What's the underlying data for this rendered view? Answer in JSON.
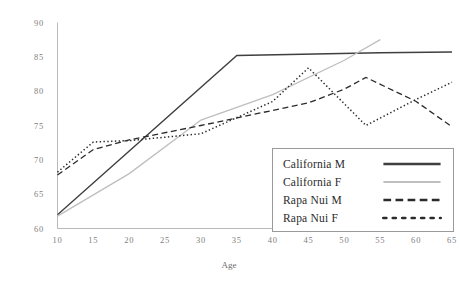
{
  "chart_data": {
    "type": "line",
    "title": "",
    "xlabel": "Age",
    "ylabel": "",
    "xlim": [
      10,
      65
    ],
    "ylim": [
      60,
      90
    ],
    "xticks": [
      10,
      15,
      20,
      25,
      30,
      35,
      40,
      45,
      50,
      55,
      60,
      65
    ],
    "yticks": [
      60,
      65,
      70,
      75,
      80,
      85,
      90
    ],
    "grid": false,
    "legend_position": "center-right",
    "series": [
      {
        "name": "California M",
        "style": "solid",
        "color": "#3f3f3f",
        "x": [
          10,
          35,
          55,
          65
        ],
        "values": [
          62.0,
          85.2,
          85.6,
          85.7
        ]
      },
      {
        "name": "California F",
        "style": "solid-light",
        "color": "#bfbfbf",
        "x": [
          10,
          20,
          30,
          40,
          50,
          55
        ],
        "values": [
          61.8,
          68.0,
          75.8,
          79.5,
          84.5,
          87.5
        ]
      },
      {
        "name": "Rapa Nui M",
        "style": "dashed",
        "color": "#2b2b2b",
        "x": [
          10,
          15,
          20,
          30,
          40,
          45,
          50,
          53,
          60,
          65
        ],
        "values": [
          67.8,
          71.5,
          72.9,
          75.0,
          77.2,
          78.3,
          80.3,
          82.0,
          78.5,
          74.8
        ]
      },
      {
        "name": "Rapa Nui F",
        "style": "dotted",
        "color": "#2b2b2b",
        "x": [
          10,
          15,
          20,
          30,
          40,
          45,
          53,
          60,
          65
        ],
        "values": [
          68.2,
          72.6,
          72.8,
          73.8,
          78.5,
          83.4,
          75.0,
          78.8,
          81.3
        ]
      }
    ]
  },
  "legend": {
    "items": [
      {
        "label": "California M"
      },
      {
        "label": "California F"
      },
      {
        "label": "Rapa Nui M"
      },
      {
        "label": "Rapa Nui F"
      }
    ]
  },
  "axes": {
    "x_title": "Age",
    "x_labels": [
      "10",
      "15",
      "20",
      "25",
      "30",
      "35",
      "40",
      "45",
      "50",
      "55",
      "60",
      "65"
    ],
    "y_labels": [
      "90",
      "85",
      "80",
      "75",
      "70",
      "65",
      "60"
    ]
  }
}
